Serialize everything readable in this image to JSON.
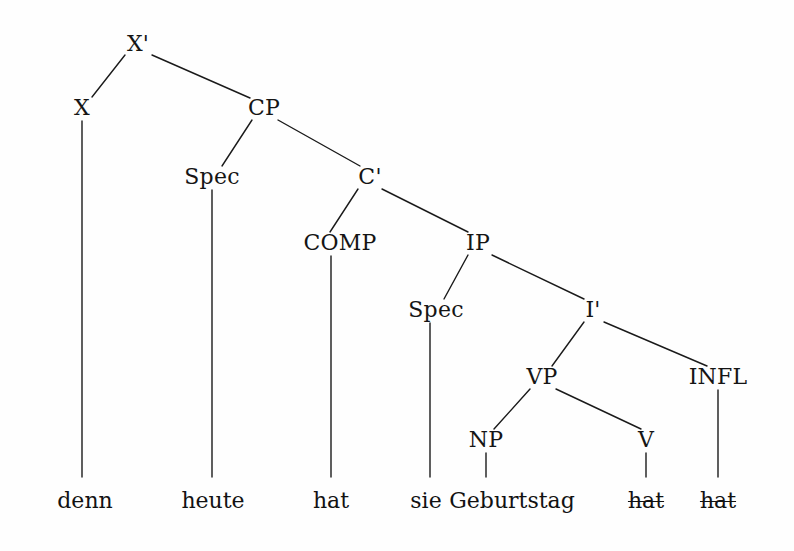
{
  "diagram": {
    "type": "syntax-tree",
    "title": "",
    "language_sample": "denn heute hat sie Geburtstag",
    "background_color": "#fefefe",
    "line_color": "#1a1a1a",
    "text_color": "#151515"
  },
  "nodes": [
    {
      "id": "xbar",
      "label": "X'",
      "x": 138,
      "y": 44,
      "kind": "nonterminal"
    },
    {
      "id": "x",
      "label": "X",
      "x": 82,
      "y": 108,
      "kind": "nonterminal"
    },
    {
      "id": "cp",
      "label": "CP",
      "x": 264,
      "y": 108,
      "kind": "nonterminal"
    },
    {
      "id": "speccp",
      "label": "Spec",
      "x": 212,
      "y": 177,
      "kind": "nonterminal"
    },
    {
      "id": "cbar",
      "label": "C'",
      "x": 370,
      "y": 177,
      "kind": "nonterminal"
    },
    {
      "id": "comp",
      "label": "COMP",
      "x": 340,
      "y": 243,
      "kind": "nonterminal"
    },
    {
      "id": "ip",
      "label": "IP",
      "x": 478,
      "y": 243,
      "kind": "nonterminal"
    },
    {
      "id": "specip",
      "label": "Spec",
      "x": 436,
      "y": 310,
      "kind": "nonterminal"
    },
    {
      "id": "ibar",
      "label": "I'",
      "x": 593,
      "y": 310,
      "kind": "nonterminal"
    },
    {
      "id": "vp",
      "label": "VP",
      "x": 542,
      "y": 377,
      "kind": "nonterminal"
    },
    {
      "id": "infl",
      "label": "INFL",
      "x": 718,
      "y": 377,
      "kind": "nonterminal"
    },
    {
      "id": "np",
      "label": "NP",
      "x": 486,
      "y": 440,
      "kind": "nonterminal"
    },
    {
      "id": "v",
      "label": "V",
      "x": 646,
      "y": 440,
      "kind": "nonterminal"
    }
  ],
  "terminals": [
    {
      "id": "t-denn",
      "label": "denn",
      "x": 85,
      "y": 490,
      "struck": false,
      "parent": "x"
    },
    {
      "id": "t-heute",
      "label": "heute",
      "x": 213,
      "y": 490,
      "struck": false,
      "parent": "speccp"
    },
    {
      "id": "t-hat1",
      "label": "hat",
      "x": 331,
      "y": 490,
      "struck": false,
      "parent": "comp"
    },
    {
      "id": "t-sie",
      "label": "sie",
      "x": 426,
      "y": 490,
      "struck": false,
      "parent": "specip"
    },
    {
      "id": "t-geburtstag",
      "label": "Geburtstag",
      "x": 512,
      "y": 490,
      "struck": false,
      "parent": "np"
    },
    {
      "id": "t-hat2",
      "label": "hat",
      "x": 646,
      "y": 490,
      "struck": true,
      "parent": "v"
    },
    {
      "id": "t-hat3",
      "label": "hat",
      "x": 718,
      "y": 490,
      "struck": true,
      "parent": "infl"
    }
  ],
  "branches": [
    {
      "from": "xbar",
      "to": "x",
      "x1": 125,
      "y1": 55,
      "x2": 92,
      "y2": 97
    },
    {
      "from": "xbar",
      "to": "cp",
      "x1": 152,
      "y1": 55,
      "x2": 250,
      "y2": 98
    },
    {
      "from": "cp",
      "to": "speccp",
      "x1": 252,
      "y1": 120,
      "x2": 222,
      "y2": 166
    },
    {
      "from": "cp",
      "to": "cbar",
      "x1": 278,
      "y1": 120,
      "x2": 360,
      "y2": 166
    },
    {
      "from": "cbar",
      "to": "comp",
      "x1": 358,
      "y1": 189,
      "x2": 330,
      "y2": 232
    },
    {
      "from": "cbar",
      "to": "ip",
      "x1": 382,
      "y1": 189,
      "x2": 468,
      "y2": 232
    },
    {
      "from": "ip",
      "to": "specip",
      "x1": 468,
      "y1": 255,
      "x2": 444,
      "y2": 299
    },
    {
      "from": "ip",
      "to": "ibar",
      "x1": 492,
      "y1": 255,
      "x2": 584,
      "y2": 299
    },
    {
      "from": "ibar",
      "to": "vp",
      "x1": 584,
      "y1": 322,
      "x2": 552,
      "y2": 366
    },
    {
      "from": "ibar",
      "to": "infl",
      "x1": 604,
      "y1": 322,
      "x2": 707,
      "y2": 366
    },
    {
      "from": "vp",
      "to": "np",
      "x1": 530,
      "y1": 389,
      "x2": 494,
      "y2": 429
    },
    {
      "from": "vp",
      "to": "v",
      "x1": 556,
      "y1": 389,
      "x2": 641,
      "y2": 429
    },
    {
      "from": "x",
      "to": "t-denn",
      "x1": 82,
      "y1": 121,
      "x2": 82,
      "y2": 477
    },
    {
      "from": "speccp",
      "to": "t-heute",
      "x1": 212,
      "y1": 190,
      "x2": 212,
      "y2": 477
    },
    {
      "from": "comp",
      "to": "t-hat1",
      "x1": 331,
      "y1": 256,
      "x2": 331,
      "y2": 477
    },
    {
      "from": "specip",
      "to": "t-sie",
      "x1": 430,
      "y1": 323,
      "x2": 430,
      "y2": 477
    },
    {
      "from": "np",
      "to": "t-geburtstag",
      "x1": 486,
      "y1": 453,
      "x2": 486,
      "y2": 477
    },
    {
      "from": "v",
      "to": "t-hat2",
      "x1": 646,
      "y1": 453,
      "x2": 646,
      "y2": 477
    },
    {
      "from": "infl",
      "to": "t-hat3",
      "x1": 718,
      "y1": 390,
      "x2": 718,
      "y2": 477
    }
  ]
}
